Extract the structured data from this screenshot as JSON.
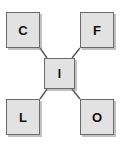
{
  "diagram": {
    "background_color": "#ffffff",
    "node_fill_color": "#e2e2e2",
    "node_border_color": "#6b6b6b",
    "label_color": "#111111",
    "edge_color": "#555555",
    "nodes": [
      {
        "id": "c",
        "label": "C",
        "position": "top-left"
      },
      {
        "id": "f",
        "label": "F",
        "position": "top-right"
      },
      {
        "id": "i",
        "label": "I",
        "position": "center"
      },
      {
        "id": "l",
        "label": "L",
        "position": "bottom-left"
      },
      {
        "id": "o",
        "label": "O",
        "position": "bottom-right"
      }
    ],
    "edges": [
      {
        "id": "c-i",
        "from": "C",
        "to": "I"
      },
      {
        "id": "f-i",
        "from": "F",
        "to": "I"
      },
      {
        "id": "l-i",
        "from": "L",
        "to": "I"
      },
      {
        "id": "o-i",
        "from": "O",
        "to": "I"
      }
    ]
  }
}
